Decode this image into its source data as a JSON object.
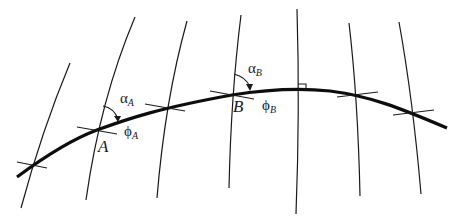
{
  "diagram": {
    "colors": {
      "ink": "#1a1a1a",
      "background": "#ffffff"
    },
    "points": [
      {
        "id": "A",
        "label": "A"
      },
      {
        "id": "B",
        "label": "B"
      }
    ],
    "angles": {
      "alpha_A": {
        "symbol": "α",
        "subscript": "A"
      },
      "phi_A": {
        "symbol": "ϕ",
        "subscript": "A"
      },
      "alpha_B": {
        "symbol": "α",
        "subscript": "B"
      },
      "phi_B": {
        "symbol": "ϕ",
        "subscript": "B"
      }
    },
    "meridian_count": 7,
    "markers": {
      "right_angle": "vertex of geodesic (perpendicular to meridian)"
    }
  }
}
